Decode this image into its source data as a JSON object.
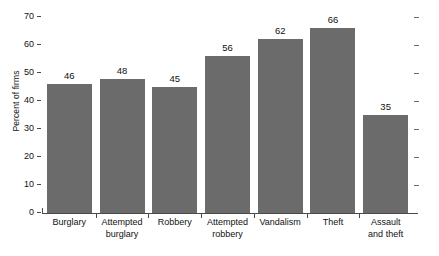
{
  "chart_data": {
    "type": "bar",
    "title": "",
    "xlabel": "",
    "ylabel": "Percent of firms",
    "ylim": [
      0,
      70
    ],
    "grid": false,
    "legend": null,
    "orientation": "vertical",
    "bar_color": "#6b6b6b",
    "categories": [
      "Burglary",
      "Attempted burglary",
      "Robbery",
      "Attempted robbery",
      "Vandalism",
      "Theft",
      "Assault and theft"
    ],
    "category_lines": [
      [
        "Burglary",
        ""
      ],
      [
        "Attempted",
        "burglary"
      ],
      [
        "Robbery",
        ""
      ],
      [
        "Attempted",
        "robbery"
      ],
      [
        "Vandalism",
        ""
      ],
      [
        "Theft",
        ""
      ],
      [
        "Assault",
        "and theft"
      ]
    ],
    "values": [
      46,
      48,
      45,
      56,
      62,
      66,
      35
    ],
    "value_labels": [
      "46",
      "48",
      "45",
      "56",
      "62",
      "66",
      "35"
    ],
    "yticks": [
      0,
      10,
      20,
      30,
      40,
      50,
      60,
      70
    ],
    "ytick_labels": [
      "0",
      "10",
      "20",
      "30",
      "40",
      "50",
      "60",
      "70"
    ]
  }
}
